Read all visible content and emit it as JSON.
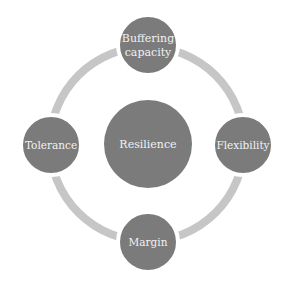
{
  "diagram": {
    "center": {
      "label": "Resilience"
    },
    "nodes": [
      {
        "label_line1": "Buffering",
        "label_line2": "capacity"
      },
      {
        "label": "Flexibility"
      },
      {
        "label": "Margin"
      },
      {
        "label": "Tolerance"
      }
    ],
    "colors": {
      "circle": "#7b7b7b",
      "ring": "#c6c6c6",
      "text": "#f2f2f2",
      "background": "#ffffff"
    }
  }
}
